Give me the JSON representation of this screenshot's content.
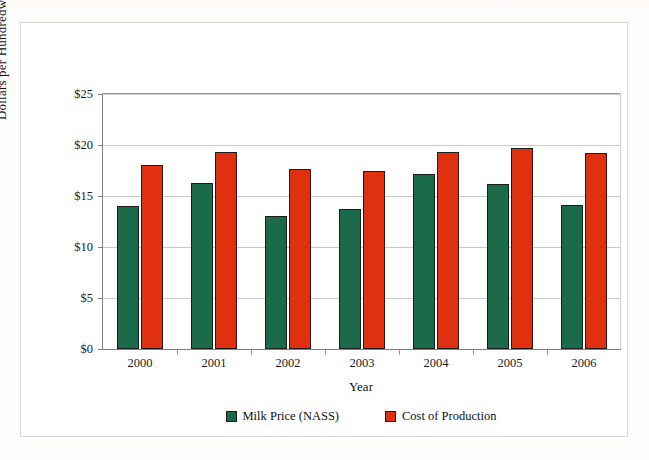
{
  "figure": {
    "background_color": "#ffffff",
    "frame_color": "#d8d8d8"
  },
  "chart_data": {
    "type": "bar",
    "title": "",
    "xlabel": "Year",
    "ylabel": "Dollars per Hundredweight",
    "categories": [
      "2000",
      "2001",
      "2002",
      "2003",
      "2004",
      "2005",
      "2006"
    ],
    "series": [
      {
        "name": "Milk Price (NASS)",
        "color": "#1b6b4b",
        "values": [
          14.0,
          16.3,
          13.0,
          13.7,
          17.2,
          16.2,
          14.1
        ]
      },
      {
        "name": "Cost of Production",
        "color": "#e0300f",
        "values": [
          18.0,
          19.3,
          17.6,
          17.5,
          19.3,
          19.7,
          19.2
        ]
      }
    ],
    "ylim": [
      0,
      25
    ],
    "yticks": [
      0,
      5,
      10,
      15,
      20,
      25
    ],
    "ytick_labels": [
      "$0",
      "$5",
      "$10",
      "$15",
      "$20",
      "$25"
    ],
    "grid": true,
    "legend_position": "bottom-center"
  }
}
